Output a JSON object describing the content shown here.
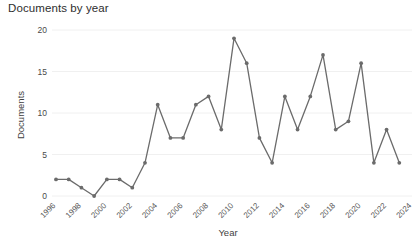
{
  "chart_data": {
    "type": "line",
    "title": "Documents by year",
    "xlabel": "Year",
    "ylabel": "Documents",
    "x": [
      1996,
      1997,
      1998,
      1999,
      2000,
      2001,
      2002,
      2003,
      2004,
      2005,
      2006,
      2007,
      2008,
      2009,
      2010,
      2011,
      2012,
      2013,
      2014,
      2015,
      2016,
      2017,
      2018,
      2019,
      2020,
      2021,
      2022,
      2023
    ],
    "values": [
      2,
      2,
      1,
      0,
      2,
      2,
      1,
      4,
      11,
      7,
      7,
      11,
      12,
      8,
      19,
      16,
      7,
      4,
      12,
      8,
      12,
      17,
      8,
      9,
      16,
      4,
      8,
      4
    ],
    "series": [
      {
        "name": "Documents",
        "values": [
          2,
          2,
          1,
          0,
          2,
          2,
          1,
          4,
          11,
          7,
          7,
          11,
          12,
          8,
          19,
          16,
          7,
          4,
          12,
          8,
          12,
          17,
          8,
          9,
          16,
          4,
          8,
          4
        ]
      }
    ],
    "xtick_labels": [
      "1996",
      "1998",
      "2000",
      "2002",
      "2004",
      "2006",
      "2008",
      "2010",
      "2012",
      "2014",
      "2016",
      "2018",
      "2020",
      "2022",
      "2024"
    ],
    "xtick_values": [
      1996,
      1998,
      2000,
      2002,
      2004,
      2006,
      2008,
      2010,
      2012,
      2014,
      2016,
      2018,
      2020,
      2022,
      2024
    ],
    "ytick_labels": [
      "0",
      "5",
      "10",
      "15",
      "20"
    ],
    "ytick_values": [
      0,
      5,
      10,
      15,
      20
    ],
    "ylim": [
      0,
      20
    ],
    "xlim": [
      1996,
      2024
    ],
    "grid": true,
    "legend": false,
    "line_color": "#6b6b6b",
    "marker_color": "#6b6b6b",
    "grid_color": "#ececec",
    "background_color": "#ffffff"
  }
}
